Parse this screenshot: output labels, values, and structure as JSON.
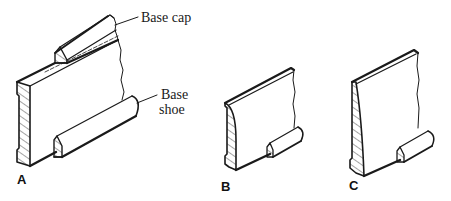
{
  "figure": {
    "callouts": {
      "base_cap": "Base cap",
      "base_shoe_line1": "Base",
      "base_shoe_line2": "shoe"
    },
    "panels": [
      {
        "label": "A",
        "description": "Two-piece baseboard with base cap and base shoe"
      },
      {
        "label": "B",
        "description": "Rounded-top one-piece baseboard with base shoe"
      },
      {
        "label": "C",
        "description": "Tapered one-piece baseboard with base shoe"
      }
    ],
    "colors": {
      "ink": "#1a1a1a",
      "background": "#ffffff"
    }
  }
}
